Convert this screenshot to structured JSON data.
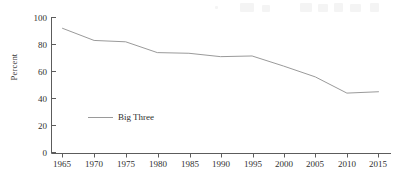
{
  "chart_data": {
    "type": "line",
    "title": "",
    "xlabel": "",
    "ylabel": "Percent",
    "xlim": [
      1963,
      2017
    ],
    "ylim": [
      0,
      100
    ],
    "grid": false,
    "legend_position": "inside-lower-left",
    "x": [
      1965,
      1970,
      1975,
      1980,
      1985,
      1990,
      1995,
      2000,
      2005,
      2010,
      2015
    ],
    "xticklabels": [
      "1965",
      "1970",
      "1975",
      "1980",
      "1985",
      "1990",
      "1995",
      "2000",
      "2005",
      "2010",
      "2015"
    ],
    "yticks": [
      0,
      20,
      40,
      60,
      80,
      100
    ],
    "yticklabels": [
      "0",
      "20",
      "40",
      "60",
      "80",
      "100"
    ],
    "series": [
      {
        "name": "Big Three",
        "color": "#9a9a9a",
        "values": [
          92,
          83,
          82,
          74,
          73.5,
          71,
          71.5,
          64,
          56,
          44,
          45
        ]
      }
    ]
  },
  "axis": {
    "y_title": "Percent",
    "y_ticks": [
      {
        "label": "100",
        "value": 100
      },
      {
        "label": "80",
        "value": 80
      },
      {
        "label": "60",
        "value": 60
      },
      {
        "label": "40",
        "value": 40
      },
      {
        "label": "20",
        "value": 20
      },
      {
        "label": "0",
        "value": 0
      }
    ],
    "x_ticks": [
      {
        "label": "1965",
        "value": 1965
      },
      {
        "label": "1970",
        "value": 1970
      },
      {
        "label": "1975",
        "value": 1975
      },
      {
        "label": "1980",
        "value": 1980
      },
      {
        "label": "1985",
        "value": 1985
      },
      {
        "label": "1990",
        "value": 1990
      },
      {
        "label": "1995",
        "value": 1995
      },
      {
        "label": "2000",
        "value": 2000
      },
      {
        "label": "2005",
        "value": 2005
      },
      {
        "label": "2010",
        "value": 2010
      },
      {
        "label": "2015",
        "value": 2015
      }
    ]
  },
  "legend": {
    "entries": [
      {
        "label": "Big Three",
        "color": "#9a9a9a"
      }
    ]
  },
  "colors": {
    "series_line": "#9a9a9a",
    "axis": "#5c5c5c",
    "text": "#2f2f2f",
    "background": "#ffffff"
  }
}
